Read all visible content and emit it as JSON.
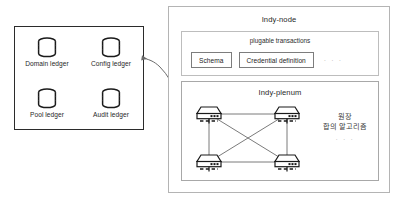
{
  "diagram": {
    "ledger_group": {
      "name": "ledger-group",
      "ledgers": [
        {
          "label": "Domain ledger",
          "icon": "database-cylinder-icon"
        },
        {
          "label": "Config ledger",
          "icon": "database-cylinder-icon"
        },
        {
          "label": "Pool ledger",
          "icon": "database-cylinder-icon"
        },
        {
          "label": "Audit ledger",
          "icon": "database-cylinder-icon"
        }
      ]
    },
    "connector": {
      "icon": "curved-arrow-left-icon",
      "from": "indy-plenum",
      "to": "ledger-group"
    },
    "indy_node": {
      "title": "Indy-node",
      "plugable_transactions": {
        "title": "plugable transactions",
        "items": [
          "Schema",
          "Credential definition"
        ],
        "more": "· · ·"
      },
      "indy_plenum": {
        "title": "Indy-plenum",
        "nodes": [
          {
            "id": "node-tl",
            "icon": "server-device-icon"
          },
          {
            "id": "node-tr",
            "icon": "server-device-icon"
          },
          {
            "id": "node-bl",
            "icon": "server-device-icon"
          },
          {
            "id": "node-br",
            "icon": "server-device-icon"
          }
        ],
        "consensus_caption": {
          "line1": "원장",
          "line2": "합의 알고리즘",
          "more": "· · ·"
        }
      }
    }
  },
  "colors": {
    "ledger_box_border": "#2b2b2b",
    "panel_border": "#b4b4b4",
    "inner_border": "#bdbdbd",
    "plenum_border": "#a8a8a8",
    "chip_border": "#7d7d7d",
    "ink": "#1f1f1f",
    "muted": "#b9b9b9",
    "line": "#6b6b6b",
    "background": "#ffffff"
  }
}
